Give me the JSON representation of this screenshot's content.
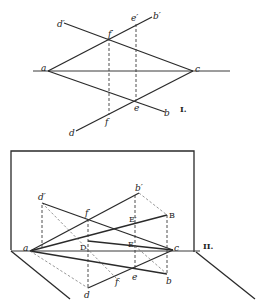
{
  "figure_1": {
    "label": "I.",
    "points": {
      "a": "a",
      "c": "c",
      "b": "b",
      "b_prime": "b′",
      "d": "d",
      "d_prime": "d′",
      "e": "e",
      "e_prime": "e′",
      "f": "f",
      "f_prime": "f′"
    }
  },
  "figure_2": {
    "label": "II.",
    "points": {
      "a": "a",
      "c": "c",
      "b": "b",
      "b_prime": "b′",
      "d": "d",
      "d_prime": "d′",
      "e": "e",
      "f": "f",
      "f_prime": "f′",
      "B": "B",
      "D": "D",
      "E": "E",
      "E_prime": "E′"
    }
  },
  "colors": {
    "line": "#2a2a2a",
    "background": "#ffffff"
  }
}
